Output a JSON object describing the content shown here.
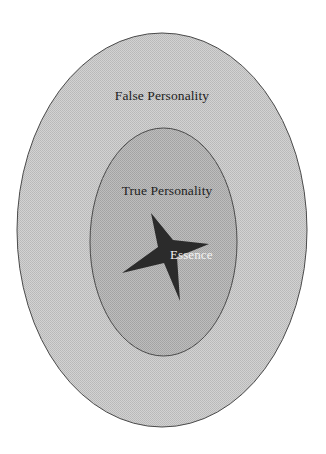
{
  "diagram": {
    "title": "",
    "layers": [
      {
        "id": "outer",
        "label": "False Personality",
        "fill": "#c9c9c9",
        "stroke": "#555555",
        "shape": "ellipse",
        "cx": 162,
        "cy": 230,
        "rx": 145,
        "ry": 197
      },
      {
        "id": "inner",
        "label": "True Personality",
        "fill": "#b3b3b3",
        "stroke": "#555555",
        "shape": "ellipse",
        "cx": 163.5,
        "cy": 242,
        "rx": 73.5,
        "ry": 114
      },
      {
        "id": "core",
        "label": "Essence",
        "fill": "#2b2b2b",
        "shape": "four-point-star",
        "text_color": "#f4f4f4"
      }
    ]
  }
}
